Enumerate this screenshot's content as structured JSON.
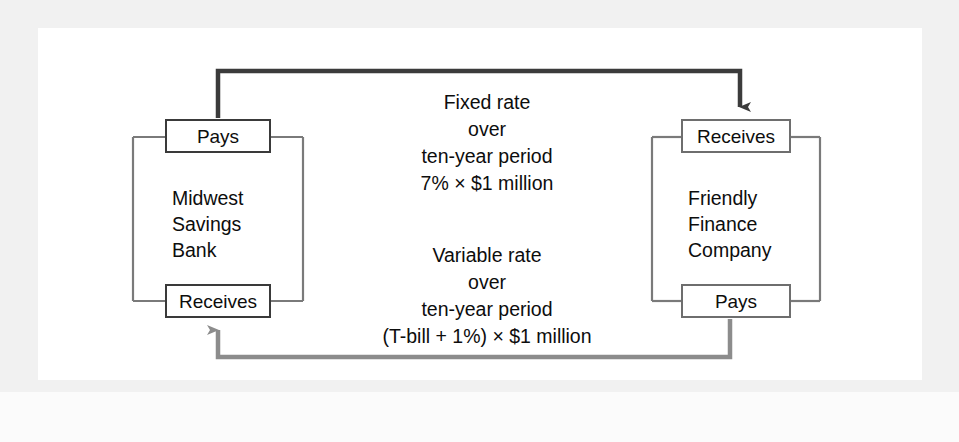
{
  "figure": {
    "type": "interest-rate-swap-diagram",
    "background_color": "#ffffff",
    "frame_color": "#f1f1f1"
  },
  "parties": {
    "left": {
      "name_lines": [
        "Midwest",
        "Savings",
        "Bank"
      ],
      "top_label": "Pays",
      "bottom_label": "Receives"
    },
    "right": {
      "name_lines": [
        "Friendly",
        "Finance",
        "Company"
      ],
      "top_label": "Receives",
      "bottom_label": "Pays"
    }
  },
  "flows": {
    "fixed": {
      "lines": [
        "Fixed rate",
        "over",
        "ten-year period",
        "7% × $1 million"
      ],
      "direction": "left-to-right",
      "color": "#3b3b3b"
    },
    "variable": {
      "lines": [
        "Variable rate",
        "over",
        "ten-year period",
        "(T-bill + 1%) × $1 million"
      ],
      "direction": "right-to-left",
      "color": "#8c8c8c"
    }
  },
  "colors": {
    "box_stroke": "#6e6e6e",
    "box_stroke_dark": "#3a3a3a",
    "connector": "#7a7a7a",
    "text": "#0d0d0d"
  }
}
